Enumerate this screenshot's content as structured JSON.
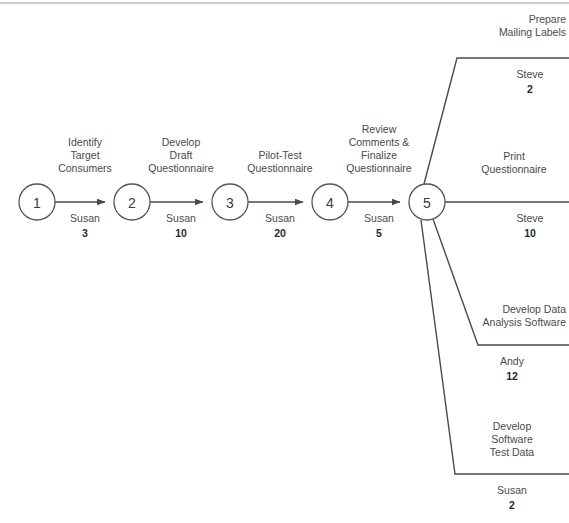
{
  "diagram": {
    "type": "activity-on-arrow",
    "colors": {
      "line": "#4a4a4a",
      "node_stroke": "#555555",
      "text": "#4a4a4a",
      "bold_text": "#2a2a2a",
      "rule": "#9a9a9a",
      "background": "#ffffff"
    },
    "nodes": [
      {
        "id": "node-1",
        "label": "1",
        "cx": 37,
        "cy": 202,
        "r": 18
      },
      {
        "id": "node-2",
        "label": "2",
        "cx": 132,
        "cy": 202,
        "r": 18
      },
      {
        "id": "node-3",
        "label": "3",
        "cx": 230,
        "cy": 202,
        "r": 18
      },
      {
        "id": "node-4",
        "label": "4",
        "cx": 330,
        "cy": 202,
        "r": 18
      },
      {
        "id": "node-5",
        "label": "5",
        "cx": 427,
        "cy": 202,
        "r": 18
      }
    ],
    "sequential_activities": [
      {
        "id": "activity-identify-target-consumers",
        "name_lines": [
          "Identify",
          "Target",
          "Consumers"
        ],
        "resource": "Susan",
        "duration": "3",
        "from": "1",
        "to": "2",
        "label_x": 85,
        "label_top_y": 146,
        "resource_y": 219,
        "duration_y": 234
      },
      {
        "id": "activity-develop-draft-questionnaire",
        "name_lines": [
          "Develop",
          "Draft",
          "Questionnaire"
        ],
        "resource": "Susan",
        "duration": "10",
        "from": "2",
        "to": "3",
        "label_x": 181,
        "label_top_y": 146,
        "resource_y": 219,
        "duration_y": 234
      },
      {
        "id": "activity-pilot-test-questionnaire",
        "name_lines": [
          "Pilot-Test",
          "Questionnaire"
        ],
        "resource": "Susan",
        "duration": "20",
        "from": "3",
        "to": "4",
        "label_x": 280,
        "label_top_y": 160,
        "resource_y": 219,
        "duration_y": 234
      },
      {
        "id": "activity-review-comments-finalize-questionnaire",
        "name_lines": [
          "Review",
          "Comments &",
          "Finalize",
          "Questionnaire"
        ],
        "resource": "Susan",
        "duration": "5",
        "from": "4",
        "to": "5",
        "label_x": 379,
        "label_top_y": 132,
        "resource_y": 219,
        "duration_y": 234
      }
    ],
    "branch_activities": [
      {
        "id": "activity-prepare-mailing-labels",
        "name_lines": [
          "Prepare",
          "Mailing Labels"
        ],
        "resource": "Steve",
        "duration": "2",
        "from": "5",
        "path": "M 424 184 L 457 58 L 569 58",
        "label_x": 566,
        "label_top_y": 22,
        "label_align": "end",
        "resource_x": 530,
        "resource_y": 75,
        "duration_x": 530,
        "duration_y": 90
      },
      {
        "id": "activity-print-questionnaire",
        "name_lines": [
          "Print",
          "Questionnaire"
        ],
        "resource": "Steve",
        "duration": "10",
        "from": "5",
        "path": "M 445 202 L 569 202",
        "label_x": 514,
        "label_top_y": 160,
        "label_align": "middle",
        "resource_x": 530,
        "resource_y": 219,
        "duration_x": 530,
        "duration_y": 234
      },
      {
        "id": "activity-develop-data-analysis-software",
        "name_lines": [
          "Develop Data",
          "Analysis Software"
        ],
        "resource": "Andy",
        "duration": "12",
        "from": "5",
        "path": "M 432 220 L 478 345 L 569 345",
        "label_x": 566,
        "label_top_y": 311,
        "label_align": "end",
        "resource_x": 512,
        "resource_y": 362,
        "duration_x": 512,
        "duration_y": 377
      },
      {
        "id": "activity-develop-software-test-data",
        "name_lines": [
          "Develop",
          "Software",
          "Test Data"
        ],
        "resource": "Susan",
        "duration": "2",
        "from": "5",
        "path": "M 422 220 L 455 474 L 569 474",
        "label_x": 512,
        "label_top_y": 428,
        "label_align": "middle",
        "resource_x": 512,
        "resource_y": 491,
        "duration_x": 512,
        "duration_y": 506
      }
    ],
    "top_rule": {
      "y": 3,
      "x1": 0,
      "x2": 569
    }
  }
}
